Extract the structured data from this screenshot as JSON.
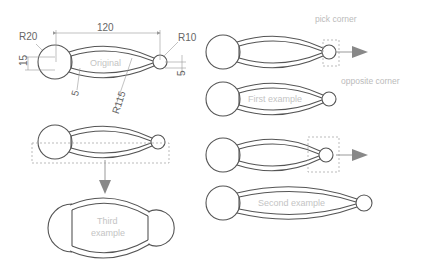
{
  "diagram": {
    "dimensions": {
      "length": "120",
      "big_radius": "R20",
      "small_radius": "R10",
      "height": "15",
      "offset_small": "5",
      "wall_thickness": "5",
      "arc_radius": "R115"
    },
    "labels": {
      "original": "Original",
      "first_example": "First example",
      "second_example": "Second example",
      "third_example_line1": "Third",
      "third_example_line2": "example",
      "pick_corner": "pick corner",
      "opposite_corner": "opposite corner"
    },
    "colors": {
      "outline": "#555555",
      "dimension": "#999999",
      "ghost_text": "#c4c4c4",
      "arrow": "#888888"
    }
  }
}
